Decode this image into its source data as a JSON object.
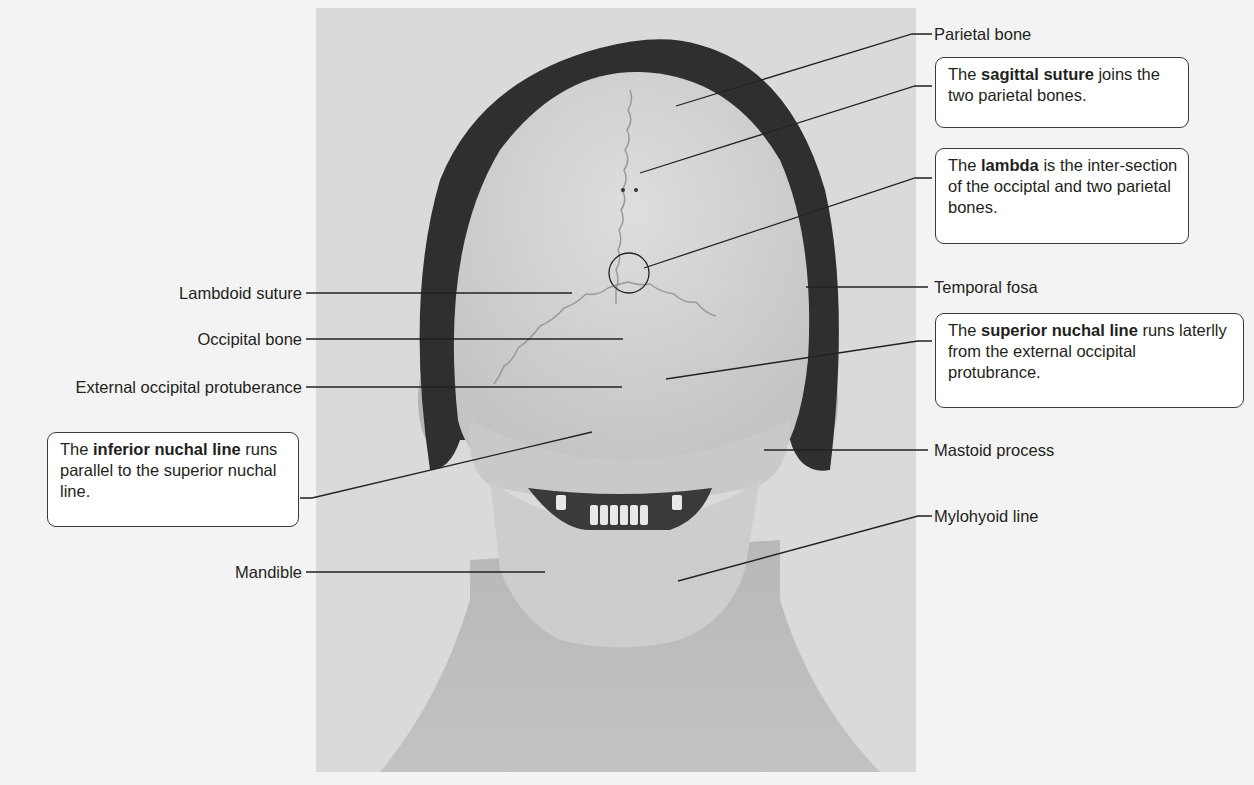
{
  "figure": {
    "colors": {
      "page_background": "#f3f3f3",
      "photo_background": "#dadada",
      "hair": "#2f2f2f",
      "skull": "#d2d2d2",
      "skin": "#bdbdbd",
      "leader_line": "#222222"
    }
  },
  "labels": {
    "parietal_bone": "Parietal bone",
    "temporal_fosa": "Temporal fosa",
    "mastoid_process": "Mastoid process",
    "mylohyoid_line": "Mylohyoid line",
    "lambdoid_suture": "Lambdoid suture",
    "occipital_bone": "Occipital bone",
    "external_occipital_protuberance": "External occipital protuberance",
    "mandible": "Mandible"
  },
  "callouts": {
    "sagittal": {
      "pre": "The ",
      "bold": "sagittal suture",
      "post": " joins the two parietal bones."
    },
    "lambda": {
      "pre": "The ",
      "bold": "lambda",
      "post": " is the inter-section of the occiptal and two parietal bones."
    },
    "superior_nuchal": {
      "pre": "The ",
      "bold": "superior nuchal line",
      "post": " runs laterlly from the external occipital protubrance."
    },
    "inferior_nuchal": {
      "pre": "The ",
      "bold": "inferior nuchal line",
      "post": " runs parallel to the superior nuchal line."
    }
  }
}
